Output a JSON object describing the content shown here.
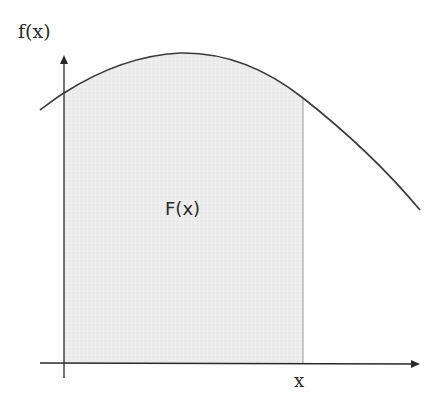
{
  "diagram": {
    "type": "area-under-curve",
    "labels": {
      "y_axis": "f(x)",
      "area": "F(x)",
      "x_marker": "x"
    },
    "colors": {
      "curve": "#3a3a3a",
      "axes": "#2a2a2a",
      "shaded_area": "#ececec",
      "area_edge": "#9a9a9a",
      "background": "#ffffff"
    }
  }
}
